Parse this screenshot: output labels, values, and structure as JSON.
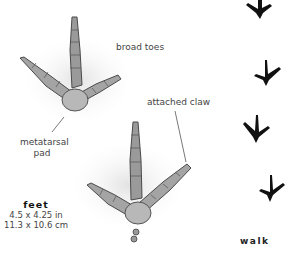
{
  "labels": {
    "broad_toes": "broad toes",
    "attached_claw": "attached claw",
    "metatarsal_pad": [
      "metatarsal",
      "pad"
    ]
  },
  "feet": {
    "title": "feet",
    "size_in": "4.5 x 4.25 in",
    "size_cm": "11.3 x 10.6 cm"
  },
  "gait": {
    "label": "walk"
  },
  "icons": {
    "large_track_top": "bird-foot-print-icon",
    "large_track_bottom": "bird-foot-print-icon",
    "small_track": "bird-foot-silhouette-icon"
  },
  "colors": {
    "background": "#ffffff",
    "track_shade": "#8a8a8a",
    "track_dark": "#3a3a3a",
    "silhouette": "#111111",
    "text": "#444444"
  }
}
